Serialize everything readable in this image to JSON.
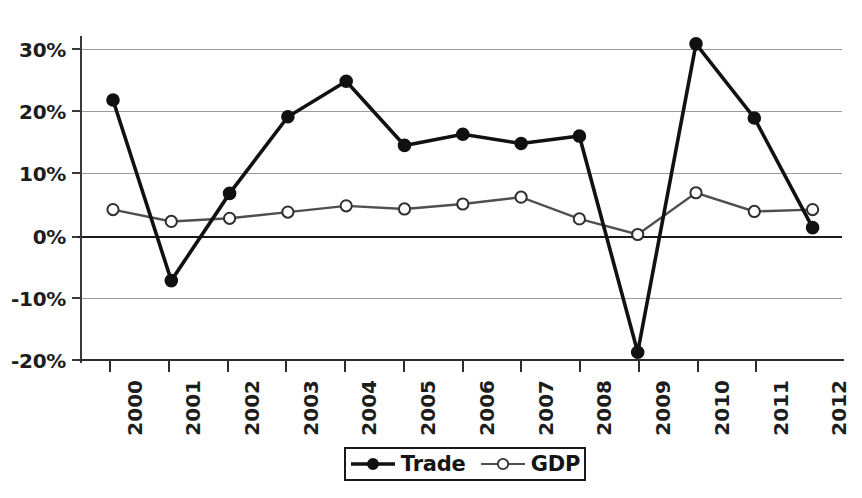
{
  "chart_data": {
    "type": "line",
    "title": "",
    "subtitle": "",
    "xlabel": "",
    "ylabel": "",
    "categories": [
      "2000",
      "2001",
      "2002",
      "2003",
      "2004",
      "2005",
      "2006",
      "2007",
      "2008",
      "2009",
      "2010",
      "2011",
      "2012"
    ],
    "ylim": [
      -20,
      30
    ],
    "yticks": [
      30,
      20,
      10,
      0,
      -10,
      -20
    ],
    "ytick_labels": [
      "30%",
      "20%",
      "10%",
      "0%",
      "-10%",
      "-20%"
    ],
    "grid": "horizontal",
    "legend_position": "bottom-center",
    "series": [
      {
        "name": "Trade",
        "marker": "filled-circle",
        "color": "#111111",
        "values": [
          22.0,
          -7.0,
          7.0,
          19.3,
          25.0,
          14.7,
          16.5,
          15.0,
          16.2,
          -18.5,
          31.0,
          19.1,
          1.5
        ]
      },
      {
        "name": "GDP",
        "marker": "open-circle",
        "color": "#4f4f4f",
        "values": [
          4.4,
          2.5,
          3.0,
          4.0,
          5.0,
          4.5,
          5.3,
          6.4,
          2.9,
          0.4,
          7.1,
          4.1,
          4.4
        ]
      }
    ]
  },
  "legend": {
    "items": [
      {
        "label": "Trade",
        "marker": "filled-circle"
      },
      {
        "label": "GDP",
        "marker": "open-circle"
      }
    ]
  },
  "colors": {
    "trade": "#111111",
    "gdp": "#4f4f4f",
    "grid": "#9a9a9a",
    "axis": "#2c2c2c",
    "text": "#1d1d1d",
    "background": "#ffffff"
  }
}
